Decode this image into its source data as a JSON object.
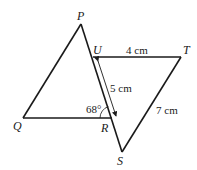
{
  "diagram": {
    "points": {
      "P": {
        "label": "P",
        "x": 81,
        "y": 24
      },
      "U": {
        "label": "U",
        "x": 93,
        "y": 57
      },
      "T": {
        "label": "T",
        "x": 181,
        "y": 57
      },
      "Q": {
        "label": "Q",
        "x": 23,
        "y": 118
      },
      "R": {
        "label": "R",
        "x": 112,
        "y": 118
      },
      "S": {
        "label": "S",
        "x": 122,
        "y": 152
      }
    },
    "measurements": {
      "UT": "4 cm",
      "UR": "5 cm",
      "TS": "7 cm",
      "angle_PRQ": "68°"
    },
    "colors": {
      "line": "#1a1a1a",
      "background": "#ffffff"
    }
  }
}
